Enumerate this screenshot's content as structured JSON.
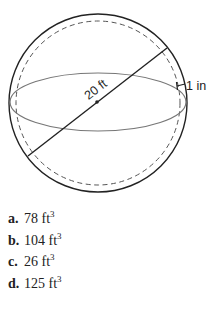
{
  "figure": {
    "diameter_label": "20 ft",
    "thickness_label": "1 in"
  },
  "choices": [
    {
      "letter": "a.",
      "value": "78 ft",
      "exponent": "3"
    },
    {
      "letter": "b.",
      "value": "104 ft",
      "exponent": "3"
    },
    {
      "letter": "c.",
      "value": "26 ft",
      "exponent": "3"
    },
    {
      "letter": "d.",
      "value": "125 ft",
      "exponent": "3"
    }
  ]
}
